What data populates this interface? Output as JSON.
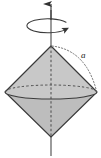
{
  "figure": {
    "name": "rotating-bipyramid-diagram",
    "background_color": "#ffffff",
    "labels": {
      "radius_label": "a"
    },
    "colors": {
      "solid_fill_upper": "#c6c6c6",
      "solid_fill_lower": "#b9b9b9",
      "outline": "#3a3a3a",
      "hidden_line": "#555555",
      "axis_line": "#4a4a4a",
      "arc_dotted": "#777777",
      "label_color": "#1a1a1a"
    },
    "geometry": {
      "axis_x": 51,
      "axis_top_y": 3,
      "axis_bottom_y": 156,
      "top_apex": {
        "x": 51,
        "y": 46
      },
      "bottom_apex": {
        "x": 51,
        "y": 137
      },
      "equator_center": {
        "x": 51,
        "y": 92
      },
      "equator_rx": 46,
      "equator_ry": 7,
      "rotation_ellipse_center": {
        "x": 51,
        "y": 25
      },
      "rotation_ellipse_rx": 21,
      "rotation_ellipse_ry": 7
    },
    "elements": {
      "axis_arrow": "vertical-rotation-axis-arrow",
      "rotation_indicator": "circular-rotation-arrow",
      "upper_cone": "upper-cone-body",
      "lower_cone": "lower-cone-body",
      "equator_visible": "equator-front-arc",
      "equator_hidden": "equator-back-arc-dashed",
      "radius_arc": "dotted-radius-arc"
    }
  }
}
